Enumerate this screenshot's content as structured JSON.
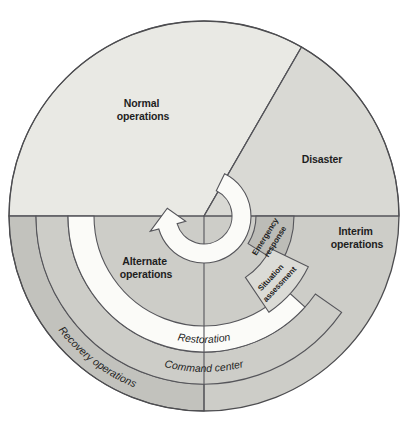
{
  "diagram": {
    "name": "disaster-recovery-operations-cycle",
    "phases": {
      "normal": {
        "line1": "Normal",
        "line2": "operations"
      },
      "disaster": {
        "line1": "Disaster"
      },
      "interim": {
        "line1": "Interim",
        "line2": "operations"
      },
      "alternate": {
        "line1": "Alternate",
        "line2": "operations"
      }
    },
    "steps": {
      "emergency": {
        "line1": "Emergency",
        "line2": "response"
      },
      "situation": {
        "line1": "Situation",
        "line2": "assessment"
      }
    },
    "rings": {
      "restoration": "Restoration",
      "command_center": "Command center",
      "recovery": "Recovery operations"
    },
    "icons": {
      "cycle_arrow": "clockwise-cycle-arrow"
    },
    "colors": {
      "normal": "#E9E9E4",
      "disaster": "#D9D9D4",
      "base_gray": "#CDCDC8",
      "recovery": "#C2C2BD",
      "emergency": "#BCBCB7",
      "situation": "#DBDBD6",
      "white_band": "#FBFBF8",
      "line": "#55555a",
      "text": "#1e1e1e"
    }
  }
}
